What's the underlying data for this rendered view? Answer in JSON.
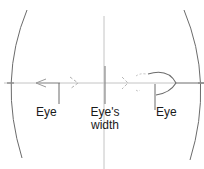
{
  "diagram": {
    "labels": {
      "left_eye": "Eye",
      "center_line1": "Eye's",
      "center_line2": "width",
      "right_eye": "Eye"
    },
    "colors": {
      "stroke": "#6b6b6b",
      "light_stroke": "#b0b0b0",
      "text": "#1a1a1a"
    }
  }
}
